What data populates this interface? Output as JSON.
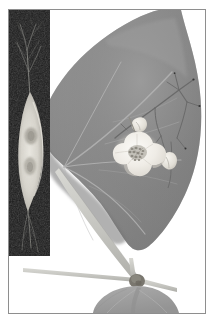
{
  "figure": {
    "background_color": "#ffffff",
    "frame_color": "#8e8e8e",
    "frame": {
      "left": 8,
      "top": 9,
      "width": 198,
      "height": 305
    }
  },
  "inset_panel": {
    "name": "micrograph-inset",
    "description": "Dark-field micrograph of an elongated spindle-shaped body with fine filaments",
    "background_color": "#141414",
    "subject_color": "#d9d7cf",
    "nucleus_color": "#a9a69c",
    "bounds": {
      "left": 0,
      "top": 0,
      "width": 41,
      "height": 246
    },
    "filament_color": "#9a9a96"
  },
  "main_subject": {
    "name": "leaf-with-flower",
    "leaf_color": "#8c8c8c",
    "leaf_shadow_color": "#7b7b7b",
    "leaf_highlight_color": "#9c9c9c",
    "vein_color": "#b6b6b6",
    "stem_color": "#c9c9c4",
    "lower_leaf_color": "#a3a3a3",
    "node_color": "#76736c"
  },
  "flower": {
    "name": "white-flower",
    "petal_color": "#f3f1ec",
    "petal_shade_color": "#ddd9d2",
    "center_color": "#9a978e",
    "lobes": 5
  },
  "buds": [
    {
      "name": "bud-upper-left",
      "color": "#e4e1da"
    },
    {
      "name": "bud-right",
      "color": "#e4e1da"
    }
  ],
  "branch": {
    "name": "branching-stem",
    "color": "#6e6e6e",
    "tip_color": "#3a3a3a"
  },
  "labels": {
    "alt_main": "Large heart-shaped leaf with a small white five-lobed flower and a branching stem",
    "alt_inset": "Dark micrograph inset showing an elongated pale body"
  }
}
